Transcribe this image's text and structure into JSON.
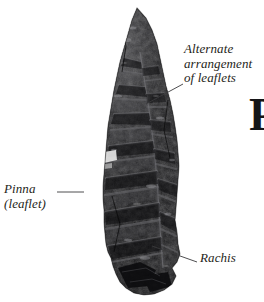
{
  "figure": {
    "background_color": "#ffffff",
    "specimen": {
      "name": "fossil-fern-frond",
      "color_dark": "#141416",
      "color_mid": "#2e2e30",
      "color_light": "#6a6a6c"
    }
  },
  "annotations": [
    {
      "name": "alternate-arrangement",
      "lines": [
        "Alternate",
        "arrangement",
        "of leaflets"
      ],
      "text": "Alternate arrangement of leaflets"
    },
    {
      "name": "pinna",
      "lines": [
        "Pinna",
        "(leaflet)"
      ],
      "text": "Pinna (leaflet)"
    },
    {
      "name": "rachis",
      "lines": [
        "Rachis"
      ],
      "text": "Rachis"
    }
  ],
  "edge_fragment": {
    "text": "P"
  },
  "leader_color": "#3a3a3c"
}
